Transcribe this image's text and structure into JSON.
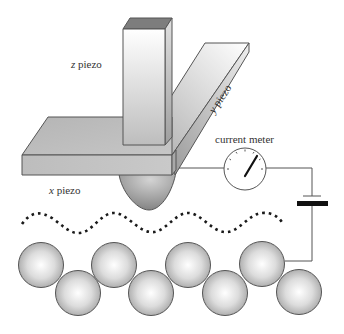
{
  "diagram": {
    "labels": {
      "z_piezo": {
        "axis": "z",
        "word": "piezo"
      },
      "y_piezo": {
        "axis": "y",
        "word": "piezo"
      },
      "x_piezo": {
        "axis": "x",
        "word": "piezo"
      },
      "current_meter": "current meter"
    },
    "components": [
      {
        "id": "z-piezo",
        "shape": "vertical rectangular bar"
      },
      {
        "id": "y-piezo",
        "shape": "diagonal rectangular bar"
      },
      {
        "id": "x-piezo",
        "shape": "horizontal rectangular slab"
      },
      {
        "id": "tip",
        "shape": "paraboloid probe tip"
      },
      {
        "id": "current-meter",
        "shape": "circular dial with needle"
      },
      {
        "id": "battery",
        "shape": "two-plate cell symbol"
      },
      {
        "id": "tunneling-path",
        "shape": "dotted wave"
      },
      {
        "id": "sample-atoms",
        "shape": "two staggered rows of spheres",
        "count": 8
      }
    ],
    "colors": {
      "outline": "#555555",
      "piezo_light": "#f2f2f2",
      "piezo_mid": "#c8c8c8",
      "piezo_dark": "#9a9a9a",
      "z_top": "#7d7d7d",
      "atom_highlight": "#ffffff",
      "atom_shade": "#a8a8a8",
      "dots": "#1a1a1a",
      "battery_plate": "#111111"
    }
  }
}
